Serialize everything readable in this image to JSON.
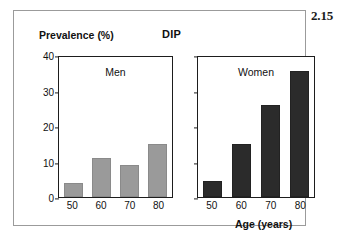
{
  "figure": {
    "number": "2.15"
  },
  "chart_data": {
    "type": "bar",
    "title": "DIP",
    "xlabel": "Age (years)",
    "ylabel": "Prevalence (%)",
    "categories": [
      "50",
      "60",
      "70",
      "80"
    ],
    "ylim": [
      0,
      40
    ],
    "yticks": [
      "0",
      "10",
      "20",
      "30",
      "40"
    ],
    "grid": false,
    "legend_position": "in-panel",
    "panels": [
      {
        "name": "Men",
        "color": "#9a9a9a",
        "values": [
          4,
          11,
          9,
          15
        ]
      },
      {
        "name": "Women",
        "color": "#2b2b2b",
        "values": [
          4.5,
          15,
          26,
          35.5
        ]
      }
    ]
  }
}
